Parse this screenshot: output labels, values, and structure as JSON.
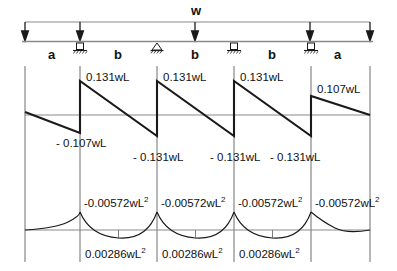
{
  "diagram": {
    "title": "w",
    "beam": {
      "left_x": 25,
      "right_x": 370,
      "load_label": "w",
      "span_labels": [
        {
          "text": "a",
          "x": 52
        },
        {
          "text": "b",
          "x": 118
        },
        {
          "text": "b",
          "x": 195
        },
        {
          "text": "b",
          "x": 272
        },
        {
          "text": "a",
          "x": 338
        }
      ],
      "supports": [
        {
          "type": "roller-support-icon",
          "x": 80
        },
        {
          "type": "pin-support-icon",
          "x": 157
        },
        {
          "type": "roller-support-icon",
          "x": 234
        },
        {
          "type": "roller-support-icon",
          "x": 311
        }
      ],
      "load_arrows_x": [
        25,
        80,
        195,
        310,
        370
      ]
    },
    "shear": {
      "name": "shear-force-diagram",
      "labels": [
        {
          "text": "0.131wL",
          "x": 86,
          "y": 72
        },
        {
          "text": "0.131wL",
          "x": 163,
          "y": 72
        },
        {
          "text": "0.131wL",
          "x": 240,
          "y": 72
        },
        {
          "text": "0.107wL",
          "x": 317,
          "y": 84
        },
        {
          "text": "- 0.107wL",
          "x": 56,
          "y": 138
        },
        {
          "text": "- 0.131wL",
          "x": 133,
          "y": 152
        },
        {
          "text": "- 0.131wL",
          "x": 210,
          "y": 152
        },
        {
          "text": "- 0.131wL",
          "x": 270,
          "y": 152
        }
      ]
    },
    "moment": {
      "name": "bending-moment-diagram",
      "hogging_labels": [
        {
          "text": "-0.00572wL",
          "sup": "2",
          "x": 84,
          "y": 196
        },
        {
          "text": "-0.00572wL",
          "sup": "2",
          "x": 161,
          "y": 196
        },
        {
          "text": "-0.00572wL",
          "sup": "2",
          "x": 238,
          "y": 196
        },
        {
          "text": "-0.00572wL",
          "sup": "2",
          "x": 315,
          "y": 196
        }
      ],
      "sagging_labels": [
        {
          "text": "0.00286wL",
          "sup": "2",
          "x": 85,
          "y": 247
        },
        {
          "text": "0.00286wL",
          "sup": "2",
          "x": 162,
          "y": 247
        },
        {
          "text": "0.00286wL",
          "sup": "2",
          "x": 239,
          "y": 247
        }
      ]
    },
    "colors": {
      "curve": "#1a1a1a",
      "axis": "#8a8a8a",
      "gridline": "#6e6e6e",
      "text": "#111111"
    }
  }
}
